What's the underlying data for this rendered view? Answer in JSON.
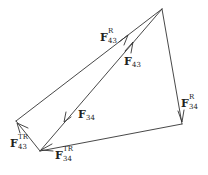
{
  "diagram": {
    "stroke_color": "#333333",
    "vertices": {
      "top": [
        162,
        9
      ],
      "right": [
        182,
        124
      ],
      "bottom": [
        40,
        151
      ],
      "left": [
        16,
        121
      ]
    },
    "labels": [
      {
        "id": "F43R",
        "base": "F",
        "sup": "R",
        "sub": "43",
        "x": 100,
        "y": 32
      },
      {
        "id": "F43",
        "base": "F",
        "sup": "",
        "sub": "43",
        "x": 124,
        "y": 57
      },
      {
        "id": "F34",
        "base": "F",
        "sup": "",
        "sub": "34",
        "x": 78,
        "y": 110
      },
      {
        "id": "F34R",
        "base": "F",
        "sup": "R",
        "sub": "34",
        "x": 181,
        "y": 98
      },
      {
        "id": "F43TR",
        "base": "F",
        "sup": "TR",
        "sub": "43",
        "x": 11,
        "y": 138
      },
      {
        "id": "F34TR",
        "base": "F",
        "sup": "TR",
        "sub": "34",
        "x": 55,
        "y": 150
      }
    ]
  }
}
